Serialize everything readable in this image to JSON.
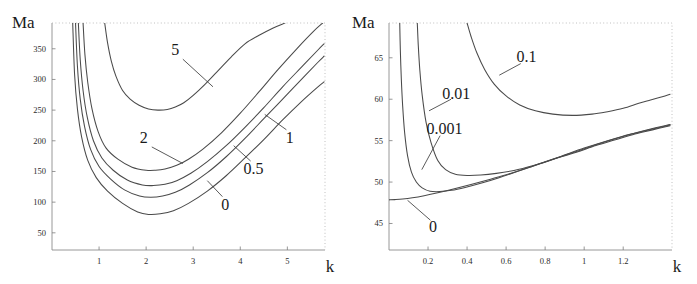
{
  "figure": {
    "title": "",
    "background": "#ffffff",
    "curve_color": "#4a4a4a",
    "axis_color": "#8d8d8d",
    "text_color": "#1a1a1a"
  },
  "chart_data": [
    {
      "type": "line",
      "panel": "left",
      "title": "",
      "xlabel": "k",
      "ylabel": "Ma",
      "xlim": [
        0,
        5.8
      ],
      "ylim": [
        22,
        392
      ],
      "xticks": [
        1,
        2,
        3,
        4,
        5
      ],
      "xtick_labels": [
        "1",
        "2",
        "3",
        "4",
        "5"
      ],
      "yticks": [
        50,
        100,
        150,
        200,
        250,
        300,
        350
      ],
      "ytick_labels": [
        "50",
        "100",
        "150",
        "200",
        "250",
        "300",
        "350"
      ],
      "grid": false,
      "legend_position": "inline-annotations",
      "series": [
        {
          "name": "5",
          "label": "5",
          "label_x": 2.62,
          "label_y": 348,
          "leader": [
            [
              2.78,
              333
            ],
            [
              3.42,
              288
            ]
          ],
          "x": [
            1.12,
            1.18,
            1.26,
            1.36,
            1.5,
            1.66,
            1.85,
            2.05,
            2.25,
            2.45,
            2.62,
            2.8,
            3.0,
            3.25,
            3.5,
            3.8,
            4.1,
            4.4,
            4.7,
            4.95
          ],
          "y": [
            392,
            360,
            330,
            305,
            282,
            268,
            258,
            252,
            250,
            251,
            255,
            262,
            274,
            292,
            312,
            336,
            358,
            372,
            384,
            392
          ]
        },
        {
          "name": "2",
          "label": "2",
          "label_x": 1.95,
          "label_y": 205,
          "leader": [
            [
              2.12,
              190
            ],
            [
              2.78,
              163
            ]
          ],
          "x": [
            0.66,
            0.7,
            0.76,
            0.85,
            0.98,
            1.15,
            1.4,
            1.7,
            2.0,
            2.2,
            2.4,
            2.65,
            2.9,
            3.2,
            3.6,
            4.0,
            4.4,
            4.8,
            5.2,
            5.55,
            5.75
          ],
          "y": [
            392,
            340,
            295,
            252,
            215,
            188,
            170,
            157,
            152,
            152,
            154,
            160,
            170,
            186,
            213,
            245,
            280,
            316,
            350,
            378,
            392
          ]
        },
        {
          "name": "1",
          "label": "1",
          "label_x": 5.05,
          "label_y": 205,
          "leader": [
            [
              4.98,
              218
            ],
            [
              4.52,
              243
            ]
          ],
          "x": [
            0.56,
            0.6,
            0.66,
            0.75,
            0.88,
            1.06,
            1.3,
            1.6,
            1.92,
            2.15,
            2.4,
            2.65,
            2.95,
            3.3,
            3.7,
            4.1,
            4.5,
            4.9,
            5.3,
            5.65,
            5.78
          ],
          "y": [
            392,
            332,
            282,
            238,
            200,
            172,
            152,
            136,
            128,
            127,
            129,
            135,
            147,
            166,
            192,
            222,
            254,
            288,
            320,
            348,
            358
          ]
        },
        {
          "name": "0.5",
          "label": "0.5",
          "label_x": 4.28,
          "label_y": 154,
          "leader": [
            [
              4.22,
              167
            ],
            [
              3.86,
              192
            ]
          ],
          "x": [
            0.5,
            0.54,
            0.6,
            0.69,
            0.82,
            1.0,
            1.24,
            1.54,
            1.86,
            2.1,
            2.35,
            2.62,
            2.92,
            3.3,
            3.7,
            4.1,
            4.5,
            4.9,
            5.3,
            5.65,
            5.78
          ],
          "y": [
            392,
            322,
            268,
            224,
            186,
            158,
            138,
            120,
            110,
            108,
            110,
            116,
            128,
            148,
            174,
            204,
            236,
            268,
            300,
            328,
            338
          ]
        },
        {
          "name": "0",
          "label": "0",
          "label_x": 3.68,
          "label_y": 96,
          "leader": [
            [
              3.62,
              109
            ],
            [
              3.3,
              135
            ]
          ],
          "x": [
            0.44,
            0.48,
            0.54,
            0.63,
            0.76,
            0.94,
            1.18,
            1.5,
            1.82,
            2.05,
            2.3,
            2.58,
            2.9,
            3.3,
            3.7,
            4.1,
            4.5,
            4.9,
            5.3,
            5.65,
            5.78
          ],
          "y": [
            392,
            308,
            252,
            206,
            168,
            140,
            118,
            98,
            84,
            80,
            81,
            86,
            98,
            118,
            143,
            172,
            202,
            234,
            264,
            288,
            296
          ]
        }
      ]
    },
    {
      "type": "line",
      "panel": "right",
      "title": "",
      "xlabel": "k",
      "ylabel": "Ma",
      "xlim": [
        0,
        1.45
      ],
      "ylim": [
        41.8,
        69.2
      ],
      "xticks": [
        0.2,
        0.4,
        0.6,
        0.8,
        1,
        1.2
      ],
      "xtick_labels": [
        "0.2",
        "0.4",
        "0.6",
        "0.8",
        "1",
        "1.2"
      ],
      "yticks": [
        45,
        50,
        55,
        60,
        65
      ],
      "ytick_labels": [
        "45",
        "50",
        "55",
        "60",
        "65"
      ],
      "grid": false,
      "legend_position": "inline-annotations",
      "series": [
        {
          "name": "0.1",
          "label": "0.1",
          "label_x": 0.705,
          "label_y": 65.1,
          "leader": [
            [
              0.675,
              64.3
            ],
            [
              0.565,
              62.9
            ]
          ],
          "x": [
            0.4,
            0.42,
            0.45,
            0.49,
            0.54,
            0.6,
            0.67,
            0.75,
            0.84,
            0.94,
            1.04,
            1.12,
            1.2,
            1.28,
            1.34,
            1.4,
            1.44
          ],
          "y": [
            69.2,
            67.6,
            65.6,
            63.6,
            61.8,
            60.4,
            59.3,
            58.6,
            58.2,
            58.05,
            58.2,
            58.5,
            58.9,
            59.5,
            59.9,
            60.3,
            60.6
          ]
        },
        {
          "name": "0.01",
          "label": "0.01",
          "label_x": 0.345,
          "label_y": 60.6,
          "leader": [
            [
              0.318,
              60.0
            ],
            [
              0.205,
              58.6
            ]
          ],
          "x": [
            0.145,
            0.15,
            0.158,
            0.17,
            0.19,
            0.215,
            0.25,
            0.29,
            0.34,
            0.4,
            0.47,
            0.55,
            0.64,
            0.74,
            0.85,
            0.96,
            1.06,
            1.16,
            1.26,
            1.35,
            1.44
          ],
          "y": [
            69.2,
            66.5,
            63.5,
            60.5,
            57.2,
            54.8,
            52.6,
            51.5,
            50.95,
            50.8,
            50.85,
            51.05,
            51.4,
            52.0,
            52.8,
            53.6,
            54.4,
            55.1,
            55.8,
            56.3,
            56.8
          ]
        },
        {
          "name": "0.001",
          "label": "0.001",
          "label_x": 0.285,
          "label_y": 56.4,
          "leader": [
            [
              0.262,
              55.6
            ],
            [
              0.168,
              51.5
            ]
          ],
          "x": [
            0.055,
            0.058,
            0.063,
            0.07,
            0.08,
            0.095,
            0.115,
            0.14,
            0.17,
            0.21,
            0.26,
            0.32,
            0.39,
            0.47,
            0.56,
            0.66,
            0.77,
            0.88,
            1.0,
            1.12,
            1.24,
            1.35,
            1.44
          ],
          "y": [
            69.2,
            66.0,
            62.5,
            59.2,
            56.0,
            53.2,
            51.2,
            50.0,
            49.3,
            48.9,
            48.85,
            49.0,
            49.35,
            49.85,
            50.5,
            51.3,
            52.2,
            53.1,
            54.1,
            55.0,
            55.8,
            56.4,
            56.9
          ]
        },
        {
          "name": "0",
          "label": "0",
          "label_x": 0.225,
          "label_y": 44.6,
          "leader": [
            [
              0.212,
              45.4
            ],
            [
              0.095,
              47.8
            ]
          ],
          "x": [
            0.0,
            0.03,
            0.07,
            0.12,
            0.18,
            0.25,
            0.33,
            0.42,
            0.52,
            0.63,
            0.74,
            0.86,
            0.98,
            1.1,
            1.22,
            1.33,
            1.44
          ],
          "y": [
            47.85,
            47.88,
            47.95,
            48.1,
            48.35,
            48.7,
            49.15,
            49.7,
            50.35,
            51.1,
            51.95,
            52.9,
            53.85,
            54.8,
            55.65,
            56.35,
            56.95
          ]
        }
      ]
    }
  ]
}
